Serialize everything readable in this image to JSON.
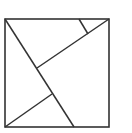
{
  "diagram": {
    "type": "tangram-square-dissection",
    "stroke_color": "#333333",
    "background": "#ffffff",
    "square": {
      "x": 5,
      "y": 19,
      "width": 104,
      "height": 108
    },
    "segments": [
      {
        "name": "long-diagonal",
        "x1": 5,
        "y1": 19,
        "x2": 74,
        "y2": 127
      },
      {
        "name": "upper-diagonal",
        "x1": 109,
        "y1": 19,
        "x2": 37,
        "y2": 68
      },
      {
        "name": "short-top-segment",
        "x1": 79,
        "y1": 19,
        "x2": 88,
        "y2": 34
      },
      {
        "name": "lower-diagonal",
        "x1": 5,
        "y1": 127,
        "x2": 52,
        "y2": 94
      }
    ]
  }
}
